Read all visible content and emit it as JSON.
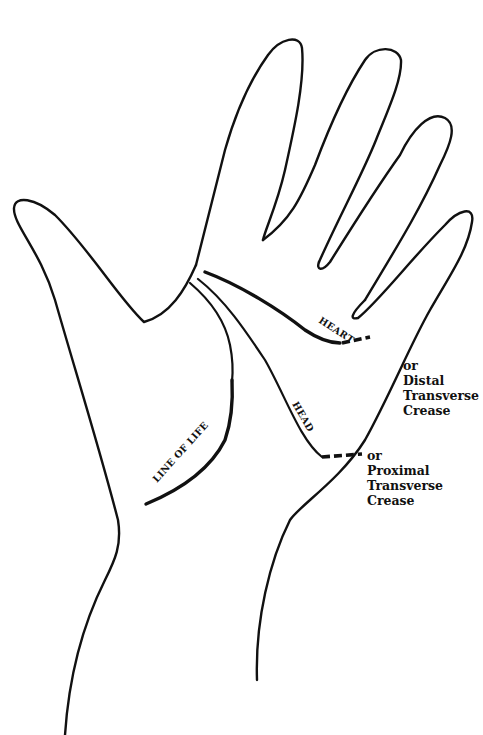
{
  "diagram": {
    "line_labels": {
      "heart": "HEART",
      "head": "HEAD",
      "life": "LINE OF LIFE"
    },
    "heart_alt": {
      "or": "or",
      "line1": "Distal",
      "line2": "Transverse",
      "line3": "Crease"
    },
    "head_alt": {
      "or": "or",
      "line1": "Proximal",
      "line2": "Transverse",
      "line3": "Crease"
    },
    "colors": {
      "ink": "#111111",
      "background": "#ffffff"
    }
  }
}
